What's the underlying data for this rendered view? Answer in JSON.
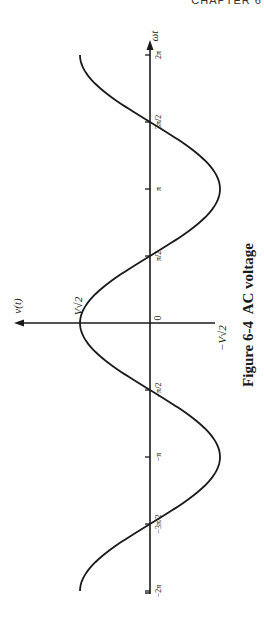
{
  "page": {
    "running_header": "CHAPTER 6"
  },
  "figure": {
    "caption": "Figure 6-4  AC voltage",
    "orientation": "rotated 90° counter-clockwise",
    "x_axis_label": "ωt",
    "y_axis_label": "v(t)",
    "peak_label": "V√2",
    "trough_label": "−V√2",
    "origin_label": "0",
    "ticks": [
      {
        "label": "−2π",
        "value": -6.2832
      },
      {
        "label": "−3π/2",
        "value": -4.7124
      },
      {
        "label": "−π",
        "value": -3.1416
      },
      {
        "label": "−π/2",
        "value": -1.5708
      },
      {
        "label": "π/2",
        "value": 1.5708
      },
      {
        "label": "π",
        "value": 3.1416
      },
      {
        "label": "3π/2",
        "value": 4.7124
      },
      {
        "label": "2π",
        "value": 6.2832
      }
    ]
  },
  "chart_data": {
    "type": "line",
    "title": "Figure 6-4  AC voltage",
    "xlabel": "ωt",
    "ylabel": "v(t)",
    "function": "v(t) = V√2 · cos(ωt)",
    "xlim": [
      -6.2832,
      6.2832
    ],
    "ylim": [
      -1,
      1
    ],
    "x_tick_labels": [
      "−2π",
      "−3π/2",
      "−π",
      "−π/2",
      "0",
      "π/2",
      "π",
      "3π/2",
      "2π"
    ],
    "y_tick_labels": [
      "−V√2",
      "V√2"
    ],
    "x": [
      -6.2832,
      -4.7124,
      -3.1416,
      -1.5708,
      0,
      1.5708,
      3.1416,
      4.7124,
      6.2832
    ],
    "series": [
      {
        "name": "v(t) (normalized to V√2)",
        "values": [
          1,
          0,
          -1,
          0,
          1,
          0,
          -1,
          0,
          1
        ]
      }
    ],
    "grid": false,
    "legend": "none"
  }
}
